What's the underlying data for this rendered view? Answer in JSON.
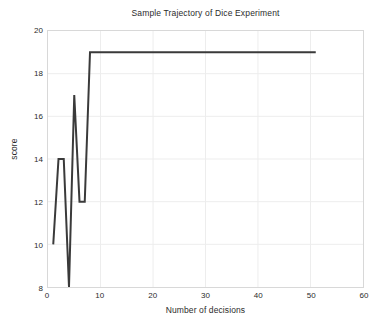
{
  "chart_data": {
    "type": "line",
    "title": "Sample Trajectory of Dice Experiment",
    "xlabel": "Number of decisions",
    "ylabel": "score",
    "xlim": [
      0,
      60
    ],
    "ylim": [
      8,
      20
    ],
    "xticks": [
      0,
      10,
      20,
      30,
      40,
      50,
      60
    ],
    "yticks": [
      8,
      10,
      12,
      14,
      16,
      18,
      20
    ],
    "grid": true,
    "legend": null,
    "line_color": "#3a3a3a",
    "line_width": 2,
    "series": [
      {
        "name": "trajectory",
        "x": [
          1,
          2,
          3,
          4,
          5,
          6,
          7,
          8,
          51
        ],
        "values": [
          10,
          14,
          14,
          8,
          17,
          12,
          12,
          19,
          19
        ]
      }
    ]
  },
  "axes": {
    "y_tick_labels": [
      "20",
      "18",
      "16",
      "14",
      "12",
      "10",
      "8"
    ],
    "x_tick_labels": [
      "0",
      "10",
      "20",
      "30",
      "40",
      "50",
      "60"
    ]
  },
  "colors": {
    "background": "#ffffff",
    "axis": "#b8b8b8",
    "grid": "#ededed",
    "text": "#2b2b2b",
    "line": "#3a3a3a"
  }
}
